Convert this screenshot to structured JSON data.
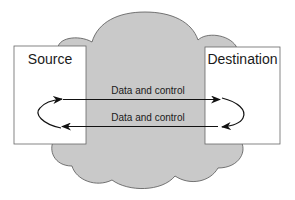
{
  "diagram": {
    "network": {
      "shape": "cloud",
      "fill": "#c8c8c8",
      "stroke": "#555555"
    },
    "nodes": {
      "source": {
        "label": "Source"
      },
      "destination": {
        "label": "Destination"
      }
    },
    "flows": [
      {
        "label": "Data and control",
        "direction": "source-to-destination"
      },
      {
        "label": "Data and control",
        "direction": "destination-to-source"
      }
    ],
    "loops": [
      {
        "side": "source",
        "description": "curved return arrow"
      },
      {
        "side": "destination",
        "description": "curved return arrow"
      }
    ]
  }
}
